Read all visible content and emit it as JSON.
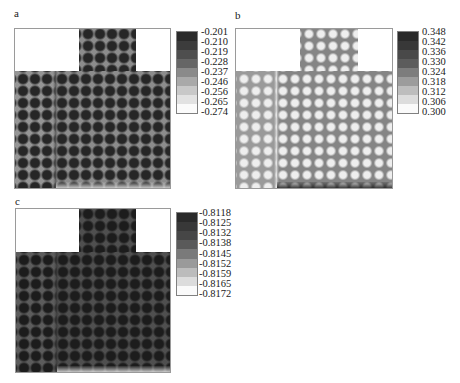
{
  "chart_data": [
    {
      "type": "heatmap",
      "panel": "a",
      "title": "a",
      "description": "T-shaped domain with periodic array of circular inclusions; inclusions appear dark (high value), matrix mid-gray",
      "colorbar": {
        "ticks": [
          "-0.201",
          "-0.210",
          "-0.219",
          "-0.228",
          "-0.237",
          "-0.246",
          "-0.256",
          "-0.265",
          "-0.274"
        ],
        "max": -0.201,
        "min": -0.274,
        "colors_top_to_bottom": [
          "#2b2b2b",
          "#3c3c3c",
          "#4e4e4e",
          "#666666",
          "#8a8a8a",
          "#a9a9a9",
          "#c8c8c8",
          "#e2e2e2",
          "#fbfbfb"
        ]
      },
      "matrix_color": "#8c8c8c",
      "left_band_color": "#959595",
      "dot_color": "#262626",
      "boundary_color": "#555555"
    },
    {
      "type": "heatmap",
      "panel": "b",
      "title": "b",
      "description": "Same T-shaped domain; inclusions appear bright (low value), bright vertical stripe at band boundary, dark strip along bottom edge",
      "colorbar": {
        "ticks": [
          "0.348",
          "0.342",
          "0.336",
          "0.330",
          "0.324",
          "0.318",
          "0.312",
          "0.306",
          "0.300"
        ],
        "max": 0.348,
        "min": 0.3,
        "colors_top_to_bottom": [
          "#2a2a2a",
          "#383838",
          "#494949",
          "#5c5c5c",
          "#7d7d7d",
          "#9c9c9c",
          "#bdbdbd",
          "#dcdcdc",
          "#fafafa"
        ]
      },
      "matrix_color": "#858585",
      "left_band_color": "#9a9a9a",
      "dot_color": "#eeeeee",
      "boundary_color": "#e6e6e6"
    },
    {
      "type": "heatmap",
      "panel": "c",
      "title": "c",
      "description": "Same T-shaped domain; overall dark field with darker inclusions",
      "colorbar": {
        "ticks": [
          "-0.8118",
          "-0.8125",
          "-0.8132",
          "-0.8138",
          "-0.8145",
          "-0.8152",
          "-0.8159",
          "-0.8165",
          "-0.8172"
        ],
        "max": -0.8118,
        "min": -0.8172,
        "colors_top_to_bottom": [
          "#2a2a2a",
          "#383838",
          "#464646",
          "#5a5a5a",
          "#7a7a7a",
          "#9a9a9a",
          "#bcbcbc",
          "#dcdcdc",
          "#fafafa"
        ]
      },
      "matrix_color": "#4f4f4f",
      "left_band_color": "#5c5c5c",
      "dot_color": "#1c1c1c",
      "boundary_color": "#3a3a3a"
    }
  ],
  "labels": {
    "a": "a",
    "b": "b",
    "c": "c"
  }
}
